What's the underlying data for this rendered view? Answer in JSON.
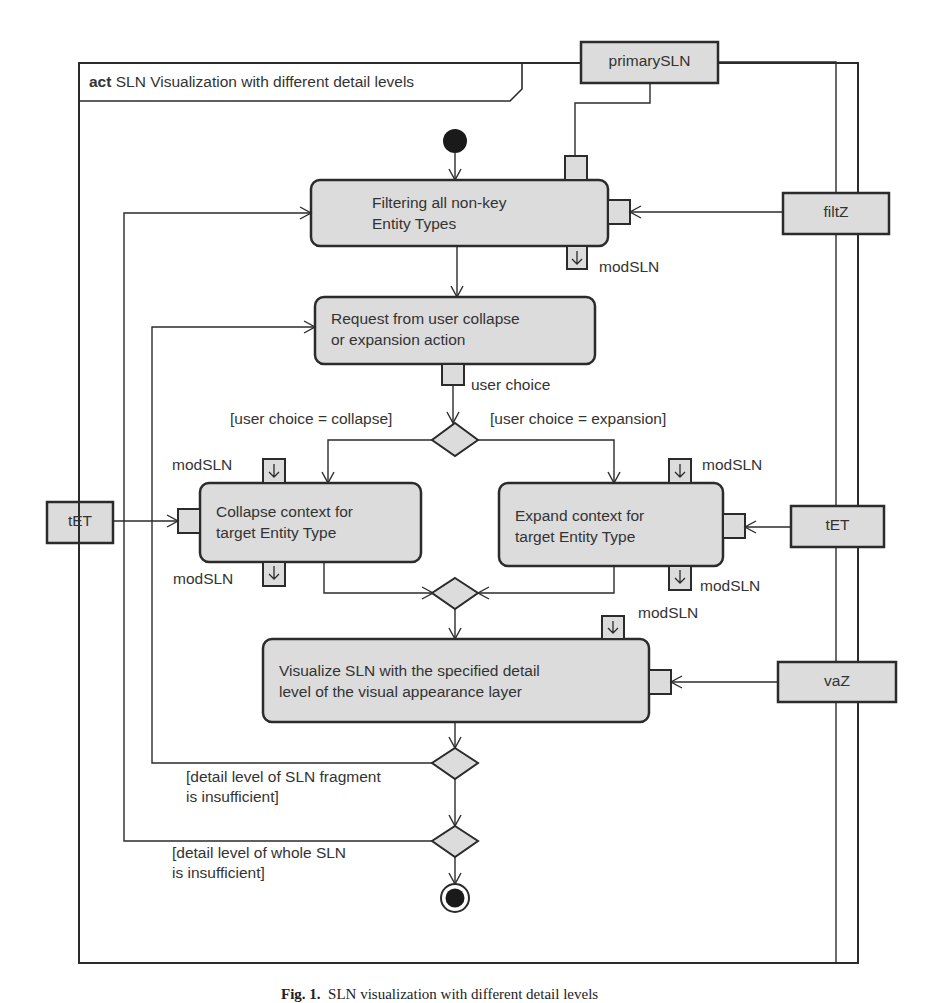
{
  "frame": {
    "keyword": "act",
    "title": "SLN Visualization with different detail levels"
  },
  "object_nodes": {
    "primary_sln": "primarySLN",
    "filt_z": "filtZ",
    "tet_left": "tET",
    "tet_right": "tET",
    "va_z": "vaZ"
  },
  "actions": {
    "filtering": "Filtering all non-key\nEntity Types",
    "request": "Request from user collapse\nor expansion action",
    "collapse": "Collapse context for\ntarget Entity Type",
    "expand": "Expand context for\ntarget Entity Type",
    "visualize": "Visualize SLN with the specified detail\nlevel of the visual appearance layer"
  },
  "pins": {
    "filtering_out": "modSLN",
    "request_out": "user choice",
    "collapse_in": "modSLN",
    "collapse_out": "modSLN",
    "expand_in": "modSLN",
    "expand_out": "modSLN",
    "visualize_in": "modSLN"
  },
  "guards": {
    "collapse": "[user choice = collapse]",
    "expansion": "[user choice = expansion]",
    "fragment_insufficient": "[detail level of SLN fragment\nis insufficient]",
    "whole_insufficient": "[detail level of whole SLN\nis insufficient]"
  },
  "colors": {
    "node_fill": "#dcdcdc",
    "stroke": "#2b2b2b",
    "background": "#ffffff"
  },
  "caption": {
    "label": "Fig. 1.",
    "text": "SLN visualization with different detail levels"
  }
}
